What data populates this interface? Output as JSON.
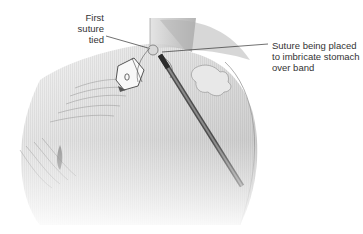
{
  "figure": {
    "colors": {
      "tissue_light": "#e8e8e8",
      "tissue_mid": "#bdbdbd",
      "tissue_dark": "#8a8a8a",
      "instrument": "#6d6d6d",
      "leader_line": "#333333",
      "text": "#333333"
    }
  },
  "labels": {
    "first_suture": {
      "lines": [
        "First",
        "suture",
        "tied"
      ]
    },
    "suture_placed": {
      "lines": [
        "Suture being placed",
        "to imbricate stomach",
        "over band"
      ]
    }
  }
}
